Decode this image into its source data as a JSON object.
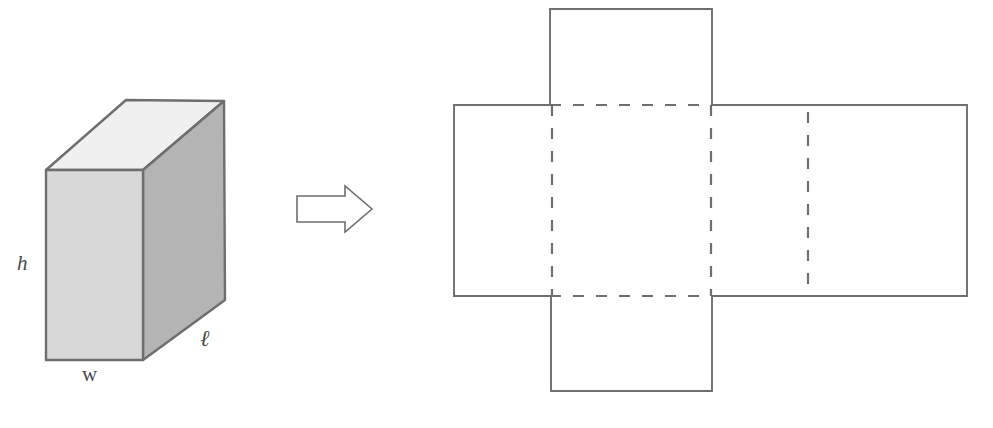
{
  "figure": {
    "background_color": "#ffffff",
    "outline_color": "#6e6e6e",
    "label_color": "#4a4a4a"
  },
  "prism": {
    "name": "rectangular-prism",
    "faces": {
      "front": {
        "label": "front-face",
        "fill": "#d8d8d8"
      },
      "right": {
        "label": "right-face",
        "fill": "#b4b4b4"
      },
      "top": {
        "label": "top-face",
        "fill": "#f0f0f0"
      }
    },
    "dimension_labels": [
      {
        "id": "height",
        "text": "h",
        "x": 22,
        "y": 270
      },
      {
        "id": "width",
        "text": "w",
        "x": 82,
        "y": 380
      },
      {
        "id": "length",
        "text": "ℓ",
        "x": 200,
        "y": 345
      }
    ]
  },
  "arrow": {
    "name": "unfold-arrow",
    "direction": "right",
    "fill": "#ffffff",
    "stroke": "#6e6e6e"
  },
  "net": {
    "name": "prism-net",
    "solid_edge_color": "#6e6e6e",
    "fold_line_color": "#6e6e6e",
    "fold_line_style": "dashed",
    "panels": [
      {
        "id": "top-flap",
        "x": 550,
        "y": 9,
        "width": 162,
        "height": 96
      },
      {
        "id": "left-panel",
        "x": 454,
        "y": 105,
        "width": 98,
        "height": 191
      },
      {
        "id": "front-panel",
        "x": 552,
        "y": 105,
        "width": 160,
        "height": 191
      },
      {
        "id": "right-panel",
        "x": 712,
        "y": 105,
        "width": 96,
        "height": 191
      },
      {
        "id": "back-panel",
        "x": 808,
        "y": 105,
        "width": 159,
        "height": 191
      },
      {
        "id": "bottom-flap",
        "x": 551,
        "y": 296,
        "width": 161,
        "height": 95
      }
    ],
    "fold_lines": [
      {
        "id": "fold-top-horizontal",
        "orientation": "horizontal",
        "x1": 552,
        "y1": 105,
        "x2": 712,
        "y2": 105
      },
      {
        "id": "fold-bottom-horizontal",
        "orientation": "horizontal",
        "x1": 552,
        "y1": 296,
        "x2": 712,
        "y2": 296
      },
      {
        "id": "fold-left-vertical",
        "orientation": "vertical",
        "x1": 552,
        "y1": 105,
        "x2": 552,
        "y2": 296
      },
      {
        "id": "fold-middle-vertical",
        "orientation": "vertical",
        "x1": 712,
        "y1": 105,
        "x2": 712,
        "y2": 296
      },
      {
        "id": "fold-right-vertical",
        "orientation": "vertical",
        "x1": 808,
        "y1": 105,
        "x2": 808,
        "y2": 296
      }
    ]
  }
}
